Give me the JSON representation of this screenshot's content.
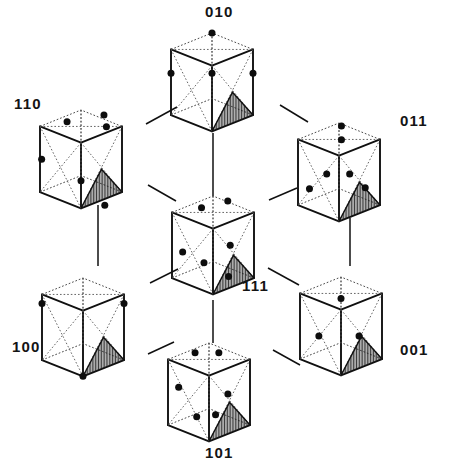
{
  "figure": {
    "background_color": "#ffffff",
    "ink_color": "#101010",
    "width": 450,
    "height": 467
  },
  "cubes": [
    {
      "id": "cube-010",
      "label": "010",
      "label_x": 205,
      "label_y": 17,
      "origin_x": 171,
      "origin_y": 33,
      "size": 82,
      "depth": 34,
      "dots": [
        {
          "x": 0.5,
          "y": 0.0,
          "face": "top-back-corner"
        },
        {
          "x": 0.5,
          "y": 0.41,
          "face": "front-top-vertex"
        },
        {
          "x": 0.0,
          "y": 0.41,
          "face": "left-front-corner"
        },
        {
          "x": 1.0,
          "y": 0.41,
          "face": "right-front-corner"
        }
      ]
    },
    {
      "id": "cube-110",
      "label": "110",
      "label_x": 14,
      "label_y": 109,
      "origin_x": 40,
      "origin_y": 110,
      "size": 82,
      "depth": 34,
      "dots": [
        {
          "x": 0.33,
          "y": 0.12,
          "face": "top-face"
        },
        {
          "x": 0.78,
          "y": 0.05,
          "face": "top-face"
        },
        {
          "x": 0.81,
          "y": 0.17,
          "face": "top-face"
        },
        {
          "x": 0.02,
          "y": 0.5,
          "face": "left-edge"
        },
        {
          "x": 0.5,
          "y": 0.72,
          "face": "front-face"
        },
        {
          "x": 0.79,
          "y": 0.97,
          "face": "hatched-triangle"
        }
      ]
    },
    {
      "id": "cube-011",
      "label": "011",
      "label_x": 400,
      "label_y": 126,
      "origin_x": 298,
      "origin_y": 123,
      "size": 82,
      "depth": 34,
      "dots": [
        {
          "x": 0.53,
          "y": 0.03,
          "face": "top-face"
        },
        {
          "x": 0.53,
          "y": 0.17,
          "face": "top-face"
        },
        {
          "x": 0.35,
          "y": 0.52,
          "face": "left-face"
        },
        {
          "x": 0.63,
          "y": 0.52,
          "face": "right-face"
        },
        {
          "x": 0.14,
          "y": 0.67,
          "face": "left-face"
        },
        {
          "x": 0.82,
          "y": 0.66,
          "face": "hatched-triangle"
        }
      ]
    },
    {
      "id": "cube-111",
      "label": "111",
      "label_x": 242,
      "label_y": 291,
      "origin_x": 172,
      "origin_y": 196,
      "size": 82,
      "depth": 34,
      "dots": [
        {
          "x": 0.36,
          "y": 0.12,
          "face": "top-face"
        },
        {
          "x": 0.68,
          "y": 0.05,
          "face": "top-face"
        },
        {
          "x": 0.71,
          "y": 0.5,
          "face": "right-face"
        },
        {
          "x": 0.13,
          "y": 0.57,
          "face": "left-face"
        },
        {
          "x": 0.39,
          "y": 0.68,
          "face": "left-face"
        },
        {
          "x": 0.69,
          "y": 0.82,
          "face": "hatched-triangle"
        }
      ]
    },
    {
      "id": "cube-100",
      "label": "100",
      "label_x": 12,
      "label_y": 352,
      "origin_x": 42,
      "origin_y": 278,
      "size": 82,
      "depth": 34,
      "dots": [
        {
          "x": 0.0,
          "y": 0.26,
          "face": "top-left-corner"
        },
        {
          "x": 1.0,
          "y": 0.26,
          "face": "top-right-corner"
        },
        {
          "x": 0.5,
          "y": 1.0,
          "face": "bottom-front-corner"
        }
      ]
    },
    {
      "id": "cube-001",
      "label": "001",
      "label_x": 400,
      "label_y": 355,
      "origin_x": 300,
      "origin_y": 277,
      "size": 82,
      "depth": 34,
      "dots": [
        {
          "x": 0.5,
          "y": 0.22,
          "face": "top-face-center"
        },
        {
          "x": 0.23,
          "y": 0.6,
          "face": "left-face"
        },
        {
          "x": 0.72,
          "y": 0.6,
          "face": "hatched-triangle-apex"
        }
      ]
    },
    {
      "id": "cube-101",
      "label": "101",
      "label_x": 205,
      "label_y": 458,
      "origin_x": 168,
      "origin_y": 343,
      "size": 82,
      "depth": 34,
      "dots": [
        {
          "x": 0.33,
          "y": 0.1,
          "face": "top-face"
        },
        {
          "x": 0.62,
          "y": 0.1,
          "face": "top-face"
        },
        {
          "x": 0.13,
          "y": 0.45,
          "face": "left-face"
        },
        {
          "x": 0.73,
          "y": 0.52,
          "face": "right-face"
        },
        {
          "x": 0.35,
          "y": 0.75,
          "face": "left-face"
        },
        {
          "x": 0.58,
          "y": 0.73,
          "face": "hatched-triangle"
        }
      ]
    }
  ],
  "connectors": [
    {
      "id": "link-110-010",
      "from": "110",
      "to": "010",
      "x1": 146,
      "y1": 124,
      "x2": 177,
      "y2": 107
    },
    {
      "id": "link-010-011",
      "from": "010",
      "to": "011",
      "x1": 280,
      "y1": 105,
      "x2": 308,
      "y2": 122
    },
    {
      "id": "link-010-111",
      "from": "010",
      "to": "111",
      "x1": 213,
      "y1": 133,
      "x2": 213,
      "y2": 196
    },
    {
      "id": "link-110-111",
      "from": "110",
      "to": "111",
      "x1": 148,
      "y1": 185,
      "x2": 176,
      "y2": 201
    },
    {
      "id": "link-011-111",
      "from": "011",
      "to": "111",
      "x1": 297,
      "y1": 188,
      "x2": 269,
      "y2": 200
    },
    {
      "id": "link-110-100",
      "from": "110",
      "to": "100",
      "x1": 98,
      "y1": 205,
      "x2": 98,
      "y2": 266
    },
    {
      "id": "link-011-001",
      "from": "011",
      "to": "001",
      "x1": 350,
      "y1": 218,
      "x2": 350,
      "y2": 266
    },
    {
      "id": "link-100-111",
      "from": "100",
      "to": "111",
      "x1": 150,
      "y1": 283,
      "x2": 178,
      "y2": 269
    },
    {
      "id": "link-111-001",
      "from": "111",
      "to": "001",
      "x1": 268,
      "y1": 268,
      "x2": 299,
      "y2": 285
    },
    {
      "id": "link-111-101",
      "from": "111",
      "to": "101",
      "x1": 213,
      "y1": 300,
      "x2": 213,
      "y2": 343
    },
    {
      "id": "link-100-101",
      "from": "100",
      "to": "101",
      "x1": 148,
      "y1": 354,
      "x2": 174,
      "y2": 342
    },
    {
      "id": "link-101-001",
      "from": "101",
      "to": "001",
      "x1": 273,
      "y1": 350,
      "x2": 300,
      "y2": 365
    }
  ],
  "legend": {
    "dot_meaning": "atom site",
    "hatch_meaning": "shaded slip-plane triangle",
    "dotted_meaning": "hidden edges and face diagonals"
  }
}
